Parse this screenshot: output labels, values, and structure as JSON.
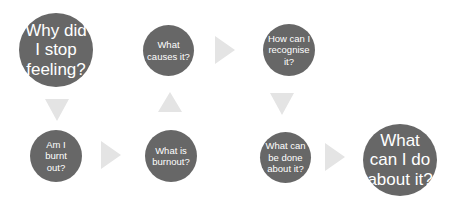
{
  "diagram": {
    "colors": {
      "node_fill": "#676767",
      "node_text": "#ffffff",
      "arrow_fill": "#e4e4e4",
      "background": "#ffffff"
    },
    "nodes": [
      {
        "id": "why-did-i-stop-feeling",
        "label": "Why did\nI stop\nfeeling?",
        "size": "big"
      },
      {
        "id": "am-i-burnt-out",
        "label": "Am I\nburnt\nout?",
        "size": "small"
      },
      {
        "id": "what-is-burnout",
        "label": "What is\nburnout?",
        "size": "small"
      },
      {
        "id": "what-causes-it",
        "label": "What\ncauses it?",
        "size": "small"
      },
      {
        "id": "how-can-i-recognise-it",
        "label": "How can I\nrecognise\nit?",
        "size": "small"
      },
      {
        "id": "what-can-be-done-about-it",
        "label": "What can\nbe done\nabout it?",
        "size": "small"
      },
      {
        "id": "what-can-i-do-about-it",
        "label": "What\ncan I do\nabout it?",
        "size": "big"
      }
    ],
    "arrows": [
      {
        "from": "why-did-i-stop-feeling",
        "to": "am-i-burnt-out",
        "direction": "down"
      },
      {
        "from": "am-i-burnt-out",
        "to": "what-is-burnout",
        "direction": "right"
      },
      {
        "from": "what-is-burnout",
        "to": "what-causes-it",
        "direction": "up"
      },
      {
        "from": "what-causes-it",
        "to": "how-can-i-recognise-it",
        "direction": "right"
      },
      {
        "from": "how-can-i-recognise-it",
        "to": "what-can-be-done-about-it",
        "direction": "down"
      },
      {
        "from": "what-can-be-done-about-it",
        "to": "what-can-i-do-about-it",
        "direction": "right"
      }
    ]
  }
}
